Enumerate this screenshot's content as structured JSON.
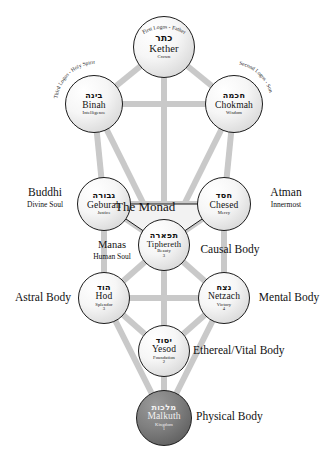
{
  "diagram": {
    "center_label": "The Monad",
    "colors": {
      "background": "#ffffff",
      "path": "#c9c9c9",
      "node_outline": "#1c1c1c",
      "node_fill": "#f0f0f0",
      "malkuth_fill": "#6f6f6f",
      "text": "#111111"
    }
  },
  "sephiroth": [
    {
      "id": "kether",
      "hebrew": "כתר",
      "name": "Kether",
      "subtitle": "Crown",
      "number": "",
      "arc_text": "First Logos - Father",
      "body_label": "",
      "body_sublabel": ""
    },
    {
      "id": "binah",
      "hebrew": "בינה",
      "name": "Binah",
      "subtitle": "Intelligence",
      "number": "",
      "arc_text": "Third Logos - Holy Spirit",
      "body_label": "",
      "body_sublabel": ""
    },
    {
      "id": "chokmah",
      "hebrew": "חכמה",
      "name": "Chokmah",
      "subtitle": "Wisdom",
      "number": "",
      "arc_text": "Second Logos - Son",
      "body_label": "",
      "body_sublabel": ""
    },
    {
      "id": "geburah",
      "hebrew": "גבורה",
      "name": "Geburah",
      "subtitle": "Justice",
      "number": "",
      "arc_text": "",
      "body_label": "Buddhi",
      "body_sublabel": "Divine Soul"
    },
    {
      "id": "chesed",
      "hebrew": "חסד",
      "name": "Chesed",
      "subtitle": "Mercy",
      "number": "",
      "arc_text": "",
      "body_label": "Atman",
      "body_sublabel": "Innermost"
    },
    {
      "id": "tiphereth",
      "hebrew": "תפארה",
      "name": "Tiphereth",
      "subtitle": "Beauty",
      "number": "3",
      "arc_text": "",
      "body_label": "Manas",
      "body_sublabel": "Human Soul"
    },
    {
      "id": "hod",
      "hebrew": "הוד",
      "name": "Hod",
      "subtitle": "Splendor",
      "number": "3",
      "arc_text": "",
      "body_label": "Astral Body",
      "body_sublabel": ""
    },
    {
      "id": "netzach",
      "hebrew": "נצח",
      "name": "Netzach",
      "subtitle": "Victory",
      "number": "4",
      "arc_text": "",
      "body_label": "Mental Body",
      "body_sublabel": ""
    },
    {
      "id": "yesod",
      "hebrew": "יסוד",
      "name": "Yesod",
      "subtitle": "Foundation",
      "number": "2",
      "arc_text": "",
      "body_label": "Ethereal/Vital Body",
      "body_sublabel": ""
    },
    {
      "id": "malkuth",
      "hebrew": "מלכות",
      "name": "Malkuth",
      "subtitle": "Kingdom",
      "number": "1",
      "arc_text": "",
      "body_label": "Physical Body",
      "body_sublabel": ""
    }
  ],
  "extra_labels": {
    "causal_body": "Causal Body"
  }
}
